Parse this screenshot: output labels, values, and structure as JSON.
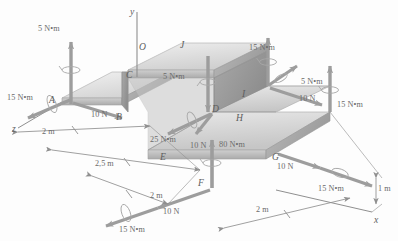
{
  "figure": {
    "type": "engineering-free-body-diagram",
    "background_color": "#fdfdfd",
    "body_color": "#d8d8d8",
    "arrow_color": "#9a9a9a",
    "text_color": "#6b6b6b"
  },
  "axes": [
    {
      "name": "y",
      "label": "y"
    },
    {
      "name": "x",
      "label": "x"
    },
    {
      "name": "z",
      "label": "z"
    }
  ],
  "points": [
    {
      "id": "O",
      "label": "O"
    },
    {
      "id": "J",
      "label": "J"
    },
    {
      "id": "A",
      "label": "A"
    },
    {
      "id": "C",
      "label": "C"
    },
    {
      "id": "B",
      "label": "B"
    },
    {
      "id": "D",
      "label": "D"
    },
    {
      "id": "I",
      "label": "I"
    },
    {
      "id": "H",
      "label": "H"
    },
    {
      "id": "E",
      "label": "E"
    },
    {
      "id": "F",
      "label": "F"
    },
    {
      "id": "G",
      "label": "G"
    }
  ],
  "loads": [
    {
      "id": "load-a-moment-up",
      "at": "A",
      "label": "5 N•m",
      "kind": "couple"
    },
    {
      "id": "load-a-moment-left",
      "at": "A",
      "label": "15 N•m",
      "kind": "couple"
    },
    {
      "id": "load-a-force",
      "at": "A",
      "label": "10 N",
      "kind": "force"
    },
    {
      "id": "load-j-moment",
      "at": "J",
      "label": "5 N•m",
      "kind": "couple"
    },
    {
      "id": "load-b-moment",
      "at": "B",
      "label": "25 N•m",
      "kind": "couple"
    },
    {
      "id": "load-i-moment-up",
      "at": "I",
      "label": "15 N•m",
      "kind": "couple"
    },
    {
      "id": "load-i-moment-diag",
      "at": "I",
      "label": "5 N•m",
      "kind": "couple"
    },
    {
      "id": "load-i-force",
      "at": "I",
      "label": "10 N",
      "kind": "force"
    },
    {
      "id": "load-g-moment-up",
      "at": "G",
      "label": "15 N•m",
      "kind": "couple"
    },
    {
      "id": "load-e-force",
      "at": "E",
      "label": "10 N",
      "kind": "force"
    },
    {
      "id": "load-f-moment-up",
      "at": "F",
      "label": "80 N•m",
      "kind": "couple"
    },
    {
      "id": "load-g-force",
      "at": "G",
      "label": "10 N",
      "kind": "force"
    },
    {
      "id": "load-g-moment-low",
      "at": "G",
      "label": "15 N•m",
      "kind": "couple"
    },
    {
      "id": "load-f-force",
      "at": "F",
      "label": "10 N",
      "kind": "force"
    },
    {
      "id": "load-f-moment-low",
      "at": "F",
      "label": "15 N•m",
      "kind": "couple"
    }
  ],
  "dimensions": [
    {
      "id": "dim-z-2m",
      "label": "2 m"
    },
    {
      "id": "dim-2p5m",
      "label": "2,5 m"
    },
    {
      "id": "dim-mid-2m",
      "label": "2 m"
    },
    {
      "id": "dim-bot-2m",
      "label": "2 m"
    },
    {
      "id": "dim-x-2m",
      "label": "2 m"
    },
    {
      "id": "dim-height",
      "label": "1 m"
    }
  ]
}
